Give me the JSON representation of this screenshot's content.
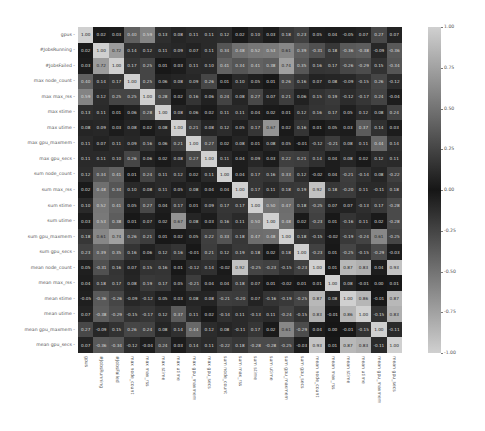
{
  "chart_data": {
    "type": "heatmap",
    "title": "",
    "xlabel": "",
    "ylabel": "",
    "labels": [
      "gpus",
      "#JobsRunning",
      "#JobsFailed",
      "max node_count",
      "max max_rss",
      "max stime",
      "max utime",
      "max gpu_maxmem",
      "max gpu_secs",
      "sum node_count",
      "sum max_rss",
      "sum stime",
      "sum utime",
      "sum gpu_maxmem",
      "sum gpu_secs",
      "mean node_count",
      "mean max_rss",
      "mean stime",
      "mean utime",
      "mean gpu_maxmem",
      "mean gpu_secs"
    ],
    "colorbar": {
      "min": -1.0,
      "max": 1.0,
      "ticks": [
        "1.00",
        "0.75",
        "0.50",
        "0.25",
        "0.00",
        "-0.25",
        "-0.50",
        "-0.75",
        "-1.00"
      ],
      "colormap": "diverging-grey (light at ±1, dark at 0)"
    },
    "values": [
      [
        1.0,
        0.02,
        0.03,
        0.4,
        0.59,
        0.13,
        0.08,
        0.11,
        0.11,
        0.12,
        0.02,
        0.1,
        0.03,
        0.18,
        0.23,
        0.05,
        0.04,
        -0.05,
        0.07,
        0.27,
        0.07
      ],
      [
        0.02,
        1.0,
        0.72,
        0.14,
        0.12,
        0.11,
        0.09,
        0.07,
        0.11,
        0.34,
        0.48,
        0.52,
        0.53,
        0.61,
        0.39,
        -0.31,
        0.18,
        -0.36,
        -0.38,
        -0.09,
        -0.36
      ],
      [
        0.03,
        0.72,
        1.0,
        0.17,
        0.25,
        0.01,
        0.03,
        0.11,
        0.1,
        0.41,
        0.34,
        0.41,
        0.38,
        0.74,
        0.35,
        0.16,
        0.17,
        -0.26,
        -0.29,
        0.15,
        -0.34
      ],
      [
        0.4,
        0.14,
        0.17,
        1.0,
        0.25,
        0.06,
        0.08,
        0.09,
        0.26,
        0.01,
        0.1,
        0.05,
        0.01,
        0.26,
        0.16,
        0.07,
        0.08,
        -0.09,
        -0.15,
        0.26,
        -0.12
      ],
      [
        0.59,
        0.12,
        0.25,
        0.25,
        1.0,
        0.28,
        0.02,
        0.16,
        0.06,
        0.24,
        0.08,
        0.27,
        0.07,
        0.21,
        0.06,
        0.15,
        0.19,
        -0.12,
        -0.17,
        0.24,
        -0.04
      ],
      [
        0.13,
        0.11,
        0.01,
        0.06,
        0.28,
        1.0,
        0.08,
        0.06,
        0.02,
        0.11,
        0.11,
        0.04,
        0.02,
        0.01,
        0.12,
        0.16,
        0.17,
        0.05,
        0.12,
        0.08,
        0.24
      ],
      [
        0.08,
        0.09,
        0.03,
        0.08,
        0.02,
        0.08,
        1.0,
        0.21,
        0.08,
        0.12,
        0.05,
        0.17,
        0.67,
        0.02,
        0.16,
        0.01,
        0.05,
        0.03,
        0.37,
        0.14,
        0.03
      ],
      [
        0.11,
        0.07,
        0.11,
        0.09,
        0.16,
        0.06,
        0.21,
        1.0,
        0.27,
        0.02,
        0.08,
        0.01,
        0.08,
        0.05,
        -0.01,
        -0.12,
        -0.21,
        0.08,
        0.11,
        0.44,
        0.14
      ],
      [
        0.11,
        0.11,
        0.1,
        0.26,
        0.06,
        0.02,
        0.08,
        0.27,
        1.0,
        0.11,
        0.04,
        0.09,
        0.03,
        0.22,
        0.21,
        0.14,
        0.04,
        0.08,
        0.02,
        0.12,
        0.11
      ],
      [
        0.12,
        0.34,
        0.41,
        0.01,
        0.24,
        0.11,
        0.12,
        0.02,
        0.11,
        1.0,
        0.04,
        0.17,
        0.16,
        0.33,
        0.12,
        -0.02,
        0.04,
        -0.21,
        -0.14,
        0.08,
        -0.22
      ],
      [
        0.02,
        0.48,
        0.34,
        0.1,
        0.08,
        0.11,
        0.05,
        0.08,
        0.04,
        0.04,
        1.0,
        0.17,
        0.11,
        0.18,
        0.19,
        0.92,
        0.18,
        -0.2,
        0.11,
        -0.11,
        0.18
      ],
      [
        0.1,
        0.52,
        0.41,
        0.05,
        0.27,
        0.04,
        0.17,
        0.01,
        0.09,
        0.17,
        0.17,
        1.0,
        0.5,
        0.47,
        0.18,
        -0.25,
        0.07,
        0.07,
        -0.13,
        0.17,
        -0.28
      ],
      [
        0.03,
        0.53,
        0.38,
        0.01,
        0.07,
        0.02,
        0.67,
        0.08,
        0.03,
        0.16,
        0.11,
        0.5,
        1.0,
        0.48,
        0.02,
        -0.23,
        0.01,
        -0.16,
        0.11,
        0.02,
        -0.28
      ],
      [
        0.18,
        0.61,
        0.74,
        0.26,
        0.21,
        0.01,
        0.02,
        0.05,
        0.22,
        0.33,
        0.18,
        0.47,
        0.48,
        1.0,
        0.18,
        -0.15,
        -0.02,
        -0.19,
        -0.24,
        0.61,
        -0.25
      ],
      [
        0.23,
        0.39,
        0.35,
        0.16,
        0.06,
        0.12,
        0.16,
        -0.01,
        0.21,
        0.12,
        0.19,
        0.18,
        0.02,
        0.18,
        1.0,
        -0.23,
        0.01,
        -0.25,
        -0.15,
        -0.29,
        -0.03
      ],
      [
        0.05,
        -0.31,
        0.16,
        0.07,
        0.15,
        0.16,
        0.01,
        -0.12,
        0.14,
        -0.02,
        0.92,
        -0.25,
        -0.23,
        -0.15,
        -0.23,
        1.0,
        0.01,
        0.87,
        0.83,
        0.04,
        0.93
      ],
      [
        0.04,
        0.18,
        0.17,
        0.08,
        0.19,
        0.17,
        0.05,
        -0.21,
        0.04,
        0.04,
        0.18,
        0.07,
        0.01,
        -0.02,
        0.01,
        0.01,
        1.0,
        0.08,
        -0.01,
        0.0,
        0.01
      ],
      [
        -0.05,
        -0.36,
        -0.26,
        -0.09,
        -0.12,
        0.05,
        0.03,
        0.08,
        0.08,
        -0.21,
        -0.2,
        0.07,
        -0.16,
        -0.19,
        -0.25,
        0.87,
        0.08,
        1.0,
        0.86,
        -0.01,
        0.87
      ],
      [
        0.07,
        -0.38,
        -0.29,
        -0.15,
        -0.17,
        0.12,
        0.37,
        0.11,
        0.02,
        -0.14,
        0.11,
        -0.13,
        0.11,
        -0.24,
        -0.15,
        0.83,
        -0.01,
        0.86,
        1.0,
        -0.15,
        0.83
      ],
      [
        0.27,
        -0.09,
        0.15,
        0.26,
        0.24,
        0.08,
        0.14,
        0.44,
        0.12,
        0.08,
        -0.11,
        0.17,
        0.02,
        0.61,
        -0.29,
        0.04,
        0.0,
        -0.01,
        -0.15,
        1.0,
        -0.11
      ],
      [
        0.07,
        -0.36,
        -0.34,
        -0.12,
        -0.04,
        0.24,
        0.03,
        0.14,
        0.11,
        -0.22,
        0.18,
        -0.28,
        -0.28,
        -0.25,
        -0.03,
        0.93,
        0.01,
        0.87,
        0.83,
        -0.11,
        1.0
      ]
    ],
    "grid": false,
    "annotated": true,
    "legend_position": "right colorbar"
  }
}
